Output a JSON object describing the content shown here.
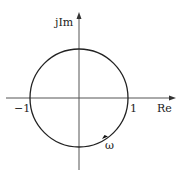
{
  "diagram": {
    "axes": {
      "real_label": "Re",
      "imag_label": "jIm"
    },
    "ticks": {
      "neg_one": "−1",
      "pos_one": "1"
    },
    "marker": {
      "label": "ω"
    },
    "colors": {
      "line": "#222222",
      "axis": "#555555"
    }
  }
}
